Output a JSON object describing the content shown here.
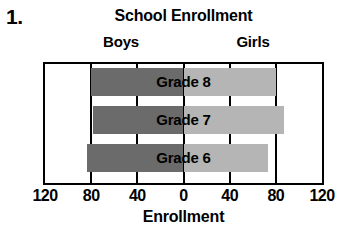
{
  "item_number": "1.",
  "side_labels": {
    "left": "Boys",
    "right": "Girls"
  },
  "colors": {
    "left_bar": "#6b6b6b",
    "right_bar": "#b5b5b5",
    "axis": "#000000",
    "background": "#ffffff"
  },
  "chart_data": {
    "type": "bar",
    "orientation": "horizontal-diverging",
    "title": "School Enrollment",
    "xlabel": "Enrollment",
    "ylabel": "",
    "xlim": [
      -120,
      120
    ],
    "xticks": [
      -120,
      -80,
      -40,
      0,
      40,
      80,
      120
    ],
    "xticklabels": [
      "120",
      "80",
      "40",
      "0",
      "40",
      "80",
      "120"
    ],
    "grid": true,
    "legend": "none",
    "categories": [
      "Grade 8",
      "Grade 7",
      "Grade 6"
    ],
    "series": [
      {
        "name": "Boys",
        "side": "left",
        "values": [
          80,
          78,
          84
        ]
      },
      {
        "name": "Girls",
        "side": "right",
        "values": [
          80,
          87,
          73
        ]
      }
    ],
    "annotations": [
      "Grade 8",
      "Grade 7",
      "Grade 6"
    ]
  }
}
